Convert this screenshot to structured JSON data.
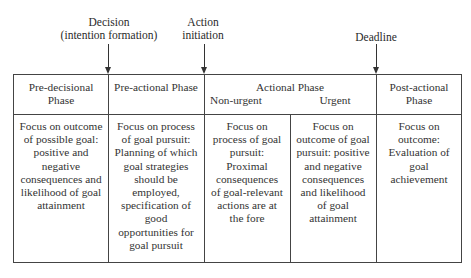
{
  "milestones": [
    {
      "id": "decision",
      "label_line1": "Decision",
      "label_line2": "(intention formation)"
    },
    {
      "id": "action-initiation",
      "label_line1": "Action",
      "label_line2": "initiation"
    },
    {
      "id": "deadline",
      "label_line1": "Deadline"
    }
  ],
  "phases": [
    {
      "header_line1": "Pre-decisional",
      "header_line2": "Phase",
      "body": [
        "Focus on outcome",
        "of possible goal:",
        "positive and",
        "negative",
        "consequences and",
        "likelihood of goal",
        "attainment"
      ]
    },
    {
      "header_line1": "Pre-actional Phase",
      "body": [
        "Focus on process",
        "of goal pursuit:",
        "Planning of which",
        "goal strategies",
        "should be",
        "employed,",
        "specification of",
        "good",
        "opportunities for",
        "goal pursuit"
      ]
    },
    {
      "header_line1": "Actional Phase",
      "subphases": [
        {
          "label": "Non-urgent",
          "body": [
            "Focus on",
            "process of goal",
            "pursuit:",
            "Proximal",
            "consequences",
            "of goal-relevant",
            "actions are at",
            "the fore"
          ]
        },
        {
          "label": "Urgent",
          "body": [
            "Focus on",
            "outcome of goal",
            "pursuit: positive",
            "and negative",
            "consequences",
            "and likelihood",
            "of goal",
            "attainment"
          ]
        }
      ]
    },
    {
      "header_line1": "Post-actional",
      "header_line2": "Phase",
      "body": [
        "Focus on",
        "outcome:",
        "Evaluation of",
        "goal",
        "achievement"
      ]
    }
  ]
}
